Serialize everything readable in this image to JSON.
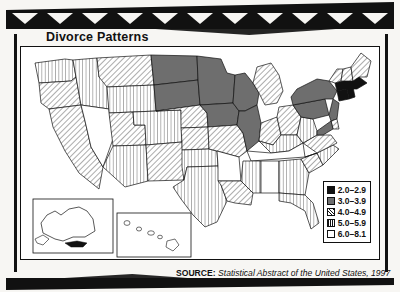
{
  "figure": {
    "title": "Divorce Patterns",
    "source_label": "SOURCE:",
    "source_text": "Statistical Abstract of the United States, 1997"
  },
  "chart_data": {
    "type": "map",
    "title": "Divorce Patterns",
    "subtitle": "",
    "unit": "divorces per 1,000 population",
    "legend_position": "bottom-right",
    "legend_title": "",
    "classes": [
      {
        "label": "2.0–2.9",
        "fill": "solid-black",
        "color": "#111111"
      },
      {
        "label": "3.0–3.9",
        "fill": "solid-gray",
        "color": "#6e6e6e"
      },
      {
        "label": "4.0–4.9",
        "fill": "diagonal-hatch",
        "color": "#ffffff"
      },
      {
        "label": "5.0–5.9",
        "fill": "vertical-stripe",
        "color": "#ffffff"
      },
      {
        "label": "6.0–8.1",
        "fill": "white",
        "color": "#ffffff"
      }
    ],
    "insets": [
      {
        "name": "Alaska",
        "class": "6.0–8.1"
      },
      {
        "name": "Hawaii",
        "class": "6.0–8.1"
      }
    ],
    "regions": [
      {
        "name": "Washington",
        "class": "5.0–5.9"
      },
      {
        "name": "Oregon",
        "class": "4.0–4.9"
      },
      {
        "name": "California",
        "class": "4.0–4.9"
      },
      {
        "name": "Idaho",
        "class": "5.0–5.9"
      },
      {
        "name": "Nevada",
        "class": "6.0–8.1"
      },
      {
        "name": "Montana",
        "class": "4.0–4.9"
      },
      {
        "name": "Wyoming",
        "class": "5.0–5.9"
      },
      {
        "name": "Utah",
        "class": "4.0–4.9"
      },
      {
        "name": "Arizona",
        "class": "5.0–5.9"
      },
      {
        "name": "Colorado",
        "class": "5.0–5.9"
      },
      {
        "name": "New Mexico",
        "class": "4.0–4.9"
      },
      {
        "name": "North Dakota",
        "class": "3.0–3.9"
      },
      {
        "name": "South Dakota",
        "class": "3.0–3.9"
      },
      {
        "name": "Nebraska",
        "class": "4.0–4.9"
      },
      {
        "name": "Kansas",
        "class": "4.0–4.9"
      },
      {
        "name": "Oklahoma",
        "class": "5.0–5.9"
      },
      {
        "name": "Texas",
        "class": "5.0–5.9"
      },
      {
        "name": "Minnesota",
        "class": "3.0–3.9"
      },
      {
        "name": "Iowa",
        "class": "3.0–3.9"
      },
      {
        "name": "Missouri",
        "class": "4.0–4.9"
      },
      {
        "name": "Arkansas",
        "class": "6.0–8.1"
      },
      {
        "name": "Louisiana",
        "class": "4.0–4.9"
      },
      {
        "name": "Wisconsin",
        "class": "3.0–3.9"
      },
      {
        "name": "Illinois",
        "class": "3.0–3.9"
      },
      {
        "name": "Michigan",
        "class": "4.0–4.9"
      },
      {
        "name": "Indiana",
        "class": "4.0–4.9"
      },
      {
        "name": "Ohio",
        "class": "4.0–4.9"
      },
      {
        "name": "Kentucky",
        "class": "5.0–5.9"
      },
      {
        "name": "Tennessee",
        "class": "6.0–8.1"
      },
      {
        "name": "Mississippi",
        "class": "5.0–5.9"
      },
      {
        "name": "Alabama",
        "class": "6.0–8.1"
      },
      {
        "name": "Georgia",
        "class": "5.0–5.9"
      },
      {
        "name": "Florida",
        "class": "5.0–5.9"
      },
      {
        "name": "South Carolina",
        "class": "4.0–4.9"
      },
      {
        "name": "North Carolina",
        "class": "5.0–5.9"
      },
      {
        "name": "Virginia",
        "class": "4.0–4.9"
      },
      {
        "name": "West Virginia",
        "class": "5.0–5.9"
      },
      {
        "name": "Pennsylvania",
        "class": "3.0–3.9"
      },
      {
        "name": "New York",
        "class": "3.0–3.9"
      },
      {
        "name": "New Jersey",
        "class": "3.0–3.9"
      },
      {
        "name": "Maryland",
        "class": "3.0–3.9"
      },
      {
        "name": "Delaware",
        "class": "4.0–4.9"
      },
      {
        "name": "Connecticut",
        "class": "2.0–2.9"
      },
      {
        "name": "Rhode Island",
        "class": "2.0–2.9"
      },
      {
        "name": "Massachusetts",
        "class": "2.0–2.9"
      },
      {
        "name": "Vermont",
        "class": "4.0–4.9"
      },
      {
        "name": "New Hampshire",
        "class": "4.0–4.9"
      },
      {
        "name": "Maine",
        "class": "4.0–4.9"
      }
    ]
  }
}
